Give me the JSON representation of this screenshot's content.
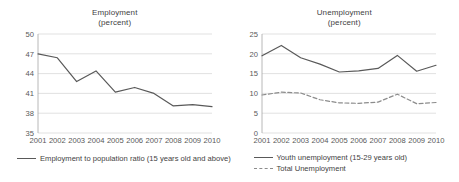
{
  "figure": {
    "background": "#ffffff",
    "line_color": "#595959",
    "dashed_color": "#8c8c8c",
    "grid_color": "#d9d9d9",
    "axis_color": "#a6a6a6"
  },
  "panels": [
    {
      "name": "employment",
      "title_line1": "Employment",
      "title_line2": "(percent)"
    },
    {
      "name": "unemployment",
      "title_line1": "Unemployment",
      "title_line2": "(percent)"
    }
  ],
  "legends": {
    "employment": [
      {
        "label": "Employment to population ratio (15 years old and above)",
        "style": "solid"
      }
    ],
    "unemployment": [
      {
        "label": "Youth unemployment (15-29 years old)",
        "style": "solid"
      },
      {
        "label": "Total Unemployment",
        "style": "dashed"
      }
    ]
  },
  "chart_data": [
    {
      "type": "line",
      "title": "Employment (percent)",
      "xlabel": "",
      "ylabel": "",
      "ylim": [
        35,
        50
      ],
      "yticks": [
        35,
        38,
        41,
        44,
        47,
        50
      ],
      "grid": true,
      "legend_position": "below",
      "categories": [
        "2001",
        "2002",
        "2003",
        "2004",
        "2005",
        "2006",
        "2007",
        "2008",
        "2009",
        "2010"
      ],
      "series": [
        {
          "name": "Employment to population ratio (15 years old and above)",
          "style": "solid",
          "color": "#595959",
          "values": [
            47.0,
            46.4,
            42.8,
            44.4,
            41.2,
            41.9,
            41.0,
            39.1,
            39.3,
            39.0
          ]
        }
      ]
    },
    {
      "type": "line",
      "title": "Unemployment (percent)",
      "xlabel": "",
      "ylabel": "",
      "ylim": [
        0,
        25
      ],
      "yticks": [
        0,
        5,
        10,
        15,
        20,
        25
      ],
      "grid": true,
      "legend_position": "below",
      "categories": [
        "2001",
        "2002",
        "2003",
        "2004",
        "2005",
        "2006",
        "2007",
        "2008",
        "2009",
        "2010"
      ],
      "series": [
        {
          "name": "Youth unemployment (15-29 years old)",
          "style": "solid",
          "color": "#595959",
          "values": [
            19.5,
            22.1,
            19.0,
            17.4,
            15.4,
            15.7,
            16.3,
            19.6,
            15.6,
            17.1
          ]
        },
        {
          "name": "Total Unemployment",
          "style": "dashed",
          "color": "#8c8c8c",
          "values": [
            9.6,
            10.3,
            10.1,
            8.4,
            7.6,
            7.5,
            7.8,
            9.8,
            7.4,
            7.7
          ]
        }
      ]
    }
  ]
}
